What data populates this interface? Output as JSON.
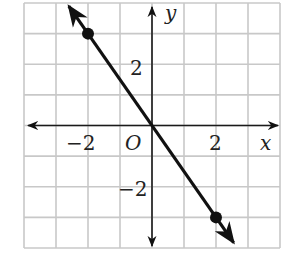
{
  "chart_data": {
    "type": "line",
    "title": "",
    "xlabel": "x",
    "ylabel": "y",
    "origin_label": "O",
    "xlim": [
      -4,
      4
    ],
    "ylim": [
      -4,
      4
    ],
    "grid": true,
    "grid_step": 1,
    "x_tick_labels": [
      {
        "value": -2,
        "label": "−2"
      },
      {
        "value": 2,
        "label": "2"
      }
    ],
    "y_tick_labels": [
      {
        "value": 2,
        "label": "2"
      },
      {
        "value": -2,
        "label": "−2"
      }
    ],
    "series": [
      {
        "name": "line",
        "equation": "y = -3/2 x",
        "slope": -1.5,
        "intercept": 0,
        "arrows_both_ends": true,
        "points": [
          {
            "x": -2,
            "y": 3
          },
          {
            "x": 2,
            "y": -3
          }
        ]
      }
    ],
    "colors": {
      "grid": "#c8c8c8",
      "axis": "#1a1a1a",
      "line": "#111111"
    }
  }
}
